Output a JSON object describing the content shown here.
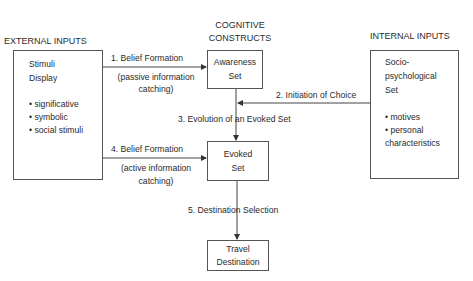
{
  "headers": {
    "external": "EXTERNAL INPUTS",
    "cognitive_line1": "COGNITIVE",
    "cognitive_line2": "CONSTRUCTS",
    "internal": "INTERNAL INPUTS"
  },
  "boxes": {
    "stimuli": {
      "title_line1": "Stimuli",
      "title_line2": "Display",
      "items": [
        "• significative",
        "• symbolic",
        "• social stimuli"
      ]
    },
    "awareness": {
      "line1": "Awareness",
      "line2": "Set"
    },
    "evoked": {
      "line1": "Evoked",
      "line2": "Set"
    },
    "travel": {
      "line1": "Travel",
      "line2": "Destination"
    },
    "socio": {
      "title_line1": "Socio-",
      "title_line2": "psychological",
      "title_line3": "Set",
      "items": [
        "• motives",
        "• personal",
        "characteristics"
      ]
    }
  },
  "arrows": {
    "a1": {
      "label": "1.  Belief Formation",
      "sub1": "(passive information",
      "sub2": "catching)"
    },
    "a2": {
      "label": "2.  Initiation of Choice"
    },
    "a3": {
      "label": "3.  Evolution of an Evoked Set"
    },
    "a4": {
      "label": "4.  Belief Formation",
      "sub1": "(active information",
      "sub2": "catching)"
    },
    "a5": {
      "label": "5.  Destination Selection"
    }
  }
}
